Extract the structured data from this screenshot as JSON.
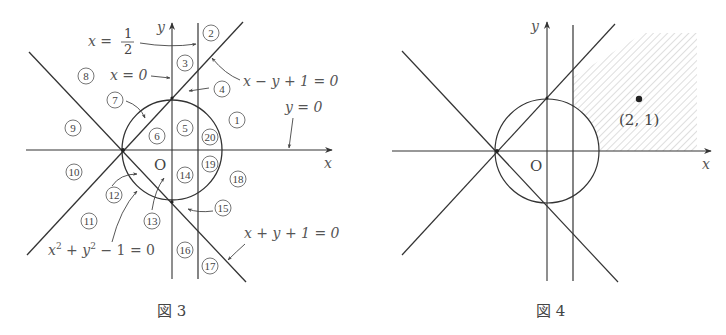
{
  "figures": [
    {
      "id": "fig3",
      "caption": "図 3",
      "axes": {
        "x_label": "x",
        "y_label": "y",
        "origin_label": "O"
      },
      "curves": [
        {
          "name": "circle",
          "equation": "x² + y² − 1 = 0"
        },
        {
          "name": "line-upper",
          "equation": "x − y + 1 = 0"
        },
        {
          "name": "line-lower",
          "equation": "x + y + 1 = 0"
        },
        {
          "name": "vertical-half",
          "equation_lhs": "x =",
          "equation_frac_num": "1",
          "equation_frac_den": "2"
        },
        {
          "name": "y-axis",
          "equation": "x = 0"
        },
        {
          "name": "x-axis",
          "equation": "y = 0"
        }
      ],
      "labels": {
        "x_half_lhs": "x =",
        "x_half_num": "1",
        "x_half_den": "2",
        "x_zero": "x = 0",
        "line_upper": "x − y + 1 = 0",
        "y_zero": "y = 0",
        "circle_eq_x": "x",
        "circle_eq_sup1": "2",
        "circle_eq_plus": " + ",
        "circle_eq_y": "y",
        "circle_eq_sup2": "2",
        "circle_eq_rest": " − 1 = 0",
        "line_lower": "x + y + 1 = 0"
      },
      "regions": [
        "1",
        "2",
        "3",
        "4",
        "5",
        "6",
        "7",
        "8",
        "9",
        "10",
        "11",
        "12",
        "13",
        "14",
        "15",
        "16",
        "17",
        "18",
        "19",
        "20"
      ]
    },
    {
      "id": "fig4",
      "caption": "図 4",
      "axes": {
        "x_label": "x",
        "y_label": "y",
        "origin_label": "O"
      },
      "shaded_region": "x ≥ 1/2, y ≥ 0, x − y + 1 ≥ 0, outside circle",
      "point": {
        "label": "(2, 1)",
        "x": 2,
        "y": 1
      }
    }
  ]
}
